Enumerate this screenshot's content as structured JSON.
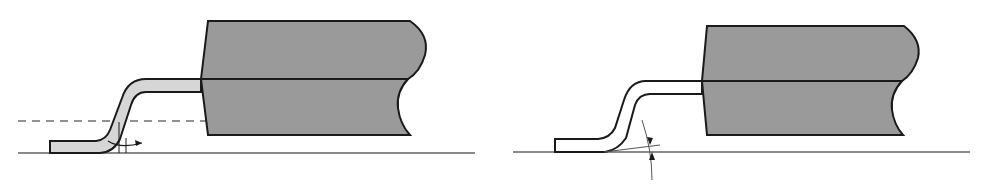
{
  "diagram": {
    "colors": {
      "background": "#ffffff",
      "body_fill": "#9a9a9a",
      "lead_fill_left": "#d6d6d6",
      "lead_fill_right": "#ffffff",
      "outline": "#1a1a1a",
      "seating_plane": "#8a8a8a",
      "dashed_reference": "#6e6e6e"
    },
    "figures": [
      {
        "id": "left",
        "subject": "package body with shaded gull-wing lead",
        "annotations": [
          "dashed reference line",
          "standoff/coplanarity dimension arrows",
          "seating plane"
        ]
      },
      {
        "id": "right",
        "subject": "package body with unshaded gull-wing lead",
        "annotations": [
          "lead foot angle arc with arrows",
          "seating plane"
        ]
      }
    ]
  }
}
